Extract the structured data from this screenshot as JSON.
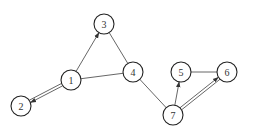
{
  "diagram": {
    "type": "graph",
    "node_radius": 10,
    "nodes": [
      {
        "id": "1",
        "label": "1",
        "x": 71,
        "y": 80
      },
      {
        "id": "2",
        "label": "2",
        "x": 21,
        "y": 106
      },
      {
        "id": "3",
        "label": "3",
        "x": 104,
        "y": 24
      },
      {
        "id": "4",
        "label": "4",
        "x": 133,
        "y": 72
      },
      {
        "id": "5",
        "label": "5",
        "x": 181,
        "y": 72
      },
      {
        "id": "6",
        "label": "6",
        "x": 227,
        "y": 72
      },
      {
        "id": "7",
        "label": "7",
        "x": 173,
        "y": 115
      }
    ],
    "edges": [
      {
        "from": "1",
        "to": "3",
        "directed": true,
        "double": false
      },
      {
        "from": "3",
        "to": "4",
        "directed": false,
        "double": false
      },
      {
        "from": "1",
        "to": "4",
        "directed": false,
        "double": false
      },
      {
        "from": "1",
        "to": "2",
        "directed": true,
        "double": true
      },
      {
        "from": "4",
        "to": "7",
        "directed": false,
        "double": false
      },
      {
        "from": "7",
        "to": "5",
        "directed": true,
        "double": false
      },
      {
        "from": "5",
        "to": "6",
        "directed": false,
        "double": false
      },
      {
        "from": "7",
        "to": "6",
        "directed": true,
        "double": true
      }
    ]
  }
}
